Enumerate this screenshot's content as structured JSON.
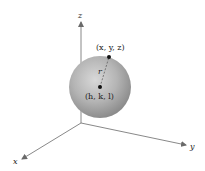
{
  "diagram": {
    "type": "sphere-in-3d-coordinates",
    "axes": {
      "x_label": "x",
      "y_label": "y",
      "z_label": "z"
    },
    "points": {
      "surface_point_label": "(x, y, z)",
      "center_label": "(h, k, l)"
    },
    "radius_label": "r",
    "colors": {
      "sphere_light": "#d6d6d6",
      "sphere_dark": "#8a8a8a",
      "axis": "#6a6a6a",
      "point": "#111111"
    }
  }
}
